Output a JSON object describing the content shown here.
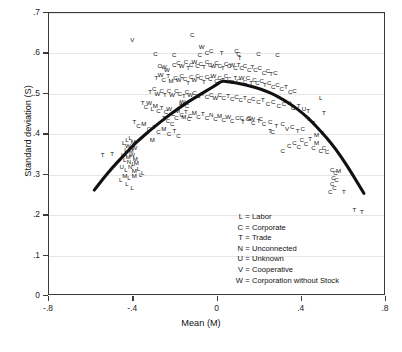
{
  "chart_data": {
    "type": "scatter",
    "title": "",
    "xlabel": "Mean (M)",
    "ylabel": "Standard deviation (S)",
    "xlim": [
      -0.8,
      0.8
    ],
    "ylim": [
      0.0,
      0.7
    ],
    "xticks": [
      "-.8",
      "-.4",
      "0",
      ".4",
      ".8"
    ],
    "xtick_values": [
      -0.8,
      -0.4,
      0,
      0.4,
      0.8
    ],
    "yticks": [
      "0",
      ".1",
      ".2",
      ".3",
      ".4",
      ".5",
      ".6",
      ".7"
    ],
    "ytick_values": [
      0,
      0.1,
      0.2,
      0.3,
      0.4,
      0.5,
      0.6,
      0.7
    ],
    "grid": "horizontal",
    "legend_position": "inside-lower-center",
    "marker_style": "letter-codes",
    "fit_curve": {
      "type": "quadratic",
      "label": "fitted quadratic",
      "color": "#111111",
      "linewidth": 3,
      "peak": [
        0.02,
        0.532
      ],
      "x_start": -0.585,
      "x_end": 0.695,
      "points": [
        [
          -0.585,
          0.262
        ],
        [
          -0.54,
          0.292
        ],
        [
          -0.495,
          0.32
        ],
        [
          -0.45,
          0.345
        ],
        [
          -0.405,
          0.37
        ],
        [
          -0.36,
          0.392
        ],
        [
          -0.315,
          0.412
        ],
        [
          -0.27,
          0.431
        ],
        [
          -0.225,
          0.449
        ],
        [
          -0.18,
          0.466
        ],
        [
          -0.135,
          0.482
        ],
        [
          -0.09,
          0.496
        ],
        [
          -0.045,
          0.51
        ],
        [
          0.0,
          0.524
        ],
        [
          0.02,
          0.532
        ],
        [
          0.045,
          0.53
        ],
        [
          0.09,
          0.527
        ],
        [
          0.135,
          0.522
        ],
        [
          0.18,
          0.516
        ],
        [
          0.225,
          0.508
        ],
        [
          0.27,
          0.498
        ],
        [
          0.315,
          0.485
        ],
        [
          0.36,
          0.47
        ],
        [
          0.405,
          0.452
        ],
        [
          0.45,
          0.43
        ],
        [
          0.495,
          0.405
        ],
        [
          0.54,
          0.378
        ],
        [
          0.585,
          0.346
        ],
        [
          0.63,
          0.31
        ],
        [
          0.695,
          0.254
        ]
      ]
    },
    "legend_entries": [
      {
        "key": "L",
        "eq": "=",
        "label": "Labor"
      },
      {
        "key": "C",
        "eq": "=",
        "label": "Corporate"
      },
      {
        "key": "T",
        "eq": "=",
        "label": "Trade"
      },
      {
        "key": "N",
        "eq": "=",
        "label": "Unconnected"
      },
      {
        "key": "U",
        "eq": "=",
        "label": "Unknown"
      },
      {
        "key": "V",
        "eq": "=",
        "label": "Cooperative"
      },
      {
        "key": "W",
        "eq": "=",
        "label": "Corporation without Stock"
      }
    ],
    "points": [
      [
        "V",
        -0.405,
        0.632
      ],
      [
        "C",
        -0.295,
        0.598
      ],
      [
        "C",
        -0.205,
        0.596
      ],
      [
        "C",
        -0.12,
        0.646
      ],
      [
        "C",
        -0.085,
        0.595
      ],
      [
        "W",
        -0.075,
        0.617
      ],
      [
        "C",
        -0.05,
        0.602
      ],
      [
        "C",
        -0.03,
        0.607
      ],
      [
        "T",
        0.02,
        0.6
      ],
      [
        "C",
        0.09,
        0.605
      ],
      [
        "C",
        0.1,
        0.598
      ],
      [
        "T",
        0.105,
        0.588
      ],
      [
        "C",
        0.195,
        0.598
      ],
      [
        "C",
        0.285,
        0.597
      ],
      [
        "C",
        -0.275,
        0.57
      ],
      [
        "W",
        -0.255,
        0.567
      ],
      [
        "W",
        -0.24,
        0.56
      ],
      [
        "C",
        -0.205,
        0.572
      ],
      [
        "C",
        -0.185,
        0.576
      ],
      [
        "W",
        -0.17,
        0.57
      ],
      [
        "C",
        -0.15,
        0.578
      ],
      [
        "T",
        -0.14,
        0.563
      ],
      [
        "C",
        -0.125,
        0.572
      ],
      [
        "W",
        -0.11,
        0.58
      ],
      [
        "C",
        -0.095,
        0.57
      ],
      [
        "C",
        -0.08,
        0.575
      ],
      [
        "T",
        -0.065,
        0.566
      ],
      [
        "C",
        -0.05,
        0.578
      ],
      [
        "C",
        -0.035,
        0.572
      ],
      [
        "W",
        -0.02,
        0.568
      ],
      [
        "C",
        -0.005,
        0.576
      ],
      [
        "C",
        0.01,
        0.57
      ],
      [
        "T",
        0.025,
        0.564
      ],
      [
        "C",
        0.04,
        0.574
      ],
      [
        "C",
        0.055,
        0.568
      ],
      [
        "W",
        0.07,
        0.571
      ],
      [
        "C",
        0.085,
        0.563
      ],
      [
        "T",
        0.1,
        0.572
      ],
      [
        "C",
        0.115,
        0.565
      ],
      [
        "C",
        0.13,
        0.57
      ],
      [
        "C",
        0.15,
        0.56
      ],
      [
        "T",
        0.165,
        0.566
      ],
      [
        "C",
        0.18,
        0.558
      ],
      [
        "C",
        0.2,
        0.563
      ],
      [
        "C",
        0.22,
        0.552
      ],
      [
        "C",
        0.24,
        0.556
      ],
      [
        "T",
        0.255,
        0.548
      ],
      [
        "C",
        0.275,
        0.552
      ],
      [
        "T",
        -0.29,
        0.54
      ],
      [
        "W",
        -0.27,
        0.546
      ],
      [
        "C",
        -0.255,
        0.535
      ],
      [
        "T",
        -0.235,
        0.543
      ],
      [
        "M",
        -0.22,
        0.531
      ],
      [
        "C",
        -0.2,
        0.54
      ],
      [
        "W",
        -0.185,
        0.534
      ],
      [
        "C",
        -0.17,
        0.544
      ],
      [
        "C",
        -0.155,
        0.536
      ],
      [
        "T",
        -0.14,
        0.528
      ],
      [
        "C",
        -0.125,
        0.542
      ],
      [
        "W",
        -0.11,
        0.534
      ],
      [
        "C",
        -0.095,
        0.545
      ],
      [
        "C",
        -0.08,
        0.538
      ],
      [
        "T",
        -0.065,
        0.53
      ],
      [
        "C",
        -0.05,
        0.541
      ],
      [
        "C",
        -0.035,
        0.536
      ],
      [
        "W",
        -0.02,
        0.544
      ],
      [
        "C",
        -0.005,
        0.533
      ],
      [
        "C",
        0.01,
        0.54
      ],
      [
        "T",
        0.025,
        0.534
      ],
      [
        "C",
        0.04,
        0.543
      ],
      [
        "C",
        0.055,
        0.536
      ],
      [
        "C",
        0.07,
        0.529
      ],
      [
        "T",
        0.085,
        0.54
      ],
      [
        "C",
        0.1,
        0.532
      ],
      [
        "W",
        0.115,
        0.538
      ],
      [
        "C",
        0.13,
        0.53
      ],
      [
        "C",
        0.145,
        0.538
      ],
      [
        "T",
        0.16,
        0.528
      ],
      [
        "C",
        0.175,
        0.534
      ],
      [
        "C",
        0.19,
        0.526
      ],
      [
        "C",
        0.21,
        0.531
      ],
      [
        "T",
        0.225,
        0.522
      ],
      [
        "C",
        0.245,
        0.527
      ],
      [
        "C",
        0.265,
        0.518
      ],
      [
        "C",
        0.285,
        0.521
      ],
      [
        "C",
        0.305,
        0.513
      ],
      [
        "T",
        0.325,
        0.516
      ],
      [
        "C",
        0.345,
        0.505
      ],
      [
        "C",
        0.365,
        0.508
      ],
      [
        "T",
        -0.32,
        0.505
      ],
      [
        "C",
        -0.3,
        0.512
      ],
      [
        "W",
        -0.285,
        0.5
      ],
      [
        "C",
        -0.265,
        0.508
      ],
      [
        "T",
        -0.25,
        0.497
      ],
      [
        "C",
        -0.23,
        0.506
      ],
      [
        "W",
        -0.215,
        0.498
      ],
      [
        "C",
        -0.195,
        0.508
      ],
      [
        "C",
        -0.18,
        0.5
      ],
      [
        "T",
        -0.16,
        0.495
      ],
      [
        "C",
        -0.145,
        0.505
      ],
      [
        "W",
        -0.13,
        0.497
      ],
      [
        "C",
        -0.11,
        0.503
      ],
      [
        "C",
        -0.09,
        0.495
      ],
      [
        "T",
        -0.07,
        0.5
      ],
      [
        "C",
        -0.05,
        0.493
      ],
      [
        "C",
        -0.03,
        0.498
      ],
      [
        "W",
        -0.01,
        0.49
      ],
      [
        "C",
        0.01,
        0.496
      ],
      [
        "C",
        0.03,
        0.489
      ],
      [
        "T",
        0.05,
        0.494
      ],
      [
        "C",
        0.07,
        0.487
      ],
      [
        "C",
        0.09,
        0.492
      ],
      [
        "C",
        0.11,
        0.485
      ],
      [
        "T",
        0.13,
        0.49
      ],
      [
        "C",
        0.15,
        0.482
      ],
      [
        "C",
        0.17,
        0.487
      ],
      [
        "C",
        0.195,
        0.479
      ],
      [
        "T",
        0.215,
        0.484
      ],
      [
        "C",
        0.24,
        0.476
      ],
      [
        "C",
        0.265,
        0.48
      ],
      [
        "C",
        0.29,
        0.471
      ],
      [
        "C",
        0.315,
        0.474
      ],
      [
        "U",
        0.34,
        0.478
      ],
      [
        "C",
        0.36,
        0.466
      ],
      [
        "T",
        0.385,
        0.47
      ],
      [
        "U",
        0.41,
        0.462
      ],
      [
        "T",
        0.43,
        0.458
      ],
      [
        "L",
        0.49,
        0.49
      ],
      [
        "T",
        0.505,
        0.452
      ],
      [
        "T",
        -0.355,
        0.477
      ],
      [
        "C",
        -0.34,
        0.468
      ],
      [
        "W",
        -0.325,
        0.478
      ],
      [
        "L",
        -0.31,
        0.462
      ],
      [
        "M",
        -0.295,
        0.47
      ],
      [
        "C",
        -0.28,
        0.458
      ],
      [
        "T",
        -0.265,
        0.466
      ],
      [
        "C",
        -0.245,
        0.455
      ],
      [
        "W",
        -0.23,
        0.462
      ],
      [
        "C",
        -0.21,
        0.45
      ],
      [
        "M",
        -0.19,
        0.458
      ],
      [
        "C",
        -0.17,
        0.448
      ],
      [
        "T",
        -0.15,
        0.455
      ],
      [
        "C",
        -0.13,
        0.445
      ],
      [
        "M",
        -0.11,
        0.452
      ],
      [
        "C",
        -0.09,
        0.443
      ],
      [
        "T",
        -0.07,
        0.45
      ],
      [
        "C",
        -0.05,
        0.44
      ],
      [
        "N",
        -0.03,
        0.448
      ],
      [
        "C",
        -0.01,
        0.438
      ],
      [
        "M",
        0.01,
        0.446
      ],
      [
        "C",
        0.03,
        0.436
      ],
      [
        "W",
        0.05,
        0.443
      ],
      [
        "C",
        0.07,
        0.433
      ],
      [
        "C",
        0.095,
        0.44
      ],
      [
        "T",
        0.12,
        0.43
      ],
      [
        "C",
        0.145,
        0.437
      ],
      [
        "C",
        0.17,
        0.428
      ],
      [
        "T",
        0.195,
        0.434
      ],
      [
        "C",
        0.22,
        0.425
      ],
      [
        "C",
        0.25,
        0.43
      ],
      [
        "T",
        0.28,
        0.42
      ],
      [
        "C",
        0.31,
        0.425
      ],
      [
        "V",
        0.33,
        0.413
      ],
      [
        "C",
        0.355,
        0.418
      ],
      [
        "T",
        0.38,
        0.408
      ],
      [
        "C",
        0.405,
        0.414
      ],
      [
        "T",
        0.43,
        0.438
      ],
      [
        "T",
        0.455,
        0.428
      ],
      [
        "M",
        0.47,
        0.398
      ],
      [
        "T",
        0.495,
        0.402
      ],
      [
        "T",
        -0.395,
        0.43
      ],
      [
        "C",
        -0.375,
        0.42
      ],
      [
        "M",
        -0.35,
        0.425
      ],
      [
        "C",
        -0.325,
        0.412
      ],
      [
        "T",
        -0.3,
        0.418
      ],
      [
        "C",
        -0.28,
        0.405
      ],
      [
        "M",
        -0.255,
        0.412
      ],
      [
        "C",
        -0.23,
        0.4
      ],
      [
        "T",
        -0.205,
        0.408
      ],
      [
        "C",
        -0.185,
        0.396
      ],
      [
        "M",
        -0.31,
        0.385
      ],
      [
        "L",
        -0.415,
        0.392
      ],
      [
        "L",
        -0.43,
        0.386
      ],
      [
        "L",
        -0.445,
        0.378
      ],
      [
        "M",
        -0.4,
        0.38
      ],
      [
        "W",
        -0.425,
        0.37
      ],
      [
        "L",
        -0.435,
        0.362
      ],
      [
        "M",
        -0.41,
        0.358
      ],
      [
        "W",
        -0.395,
        0.365
      ],
      [
        "T",
        -0.5,
        0.352
      ],
      [
        "L",
        -0.45,
        0.348
      ],
      [
        "M",
        -0.425,
        0.345
      ],
      [
        "W",
        -0.405,
        0.35
      ],
      [
        "M",
        -0.39,
        0.34
      ],
      [
        "L",
        -0.44,
        0.336
      ],
      [
        "N",
        -0.42,
        0.332
      ],
      [
        "L",
        -0.4,
        0.326
      ],
      [
        "M",
        -0.385,
        0.33
      ],
      [
        "U",
        -0.455,
        0.318
      ],
      [
        "L",
        -0.435,
        0.312
      ],
      [
        "N",
        -0.415,
        0.318
      ],
      [
        "M",
        -0.395,
        0.308
      ],
      [
        "L",
        -0.375,
        0.315
      ],
      [
        "L",
        -0.355,
        0.305
      ],
      [
        "M",
        -0.44,
        0.298
      ],
      [
        "L",
        -0.42,
        0.292
      ],
      [
        "M",
        -0.395,
        0.296
      ],
      [
        "L",
        -0.46,
        0.286
      ],
      [
        "L",
        -0.43,
        0.278
      ],
      [
        "L",
        -0.405,
        0.268
      ],
      [
        "C",
        0.34,
        0.37
      ],
      [
        "C",
        0.365,
        0.378
      ],
      [
        "C",
        0.385,
        0.368
      ],
      [
        "C",
        0.4,
        0.385
      ],
      [
        "C",
        0.42,
        0.375
      ],
      [
        "T",
        0.44,
        0.388
      ],
      [
        "C",
        0.455,
        0.365
      ],
      [
        "M",
        0.47,
        0.378
      ],
      [
        "C",
        0.49,
        0.358
      ],
      [
        "C",
        0.505,
        0.365
      ],
      [
        "C",
        0.52,
        0.355
      ],
      [
        "C",
        0.31,
        0.358
      ],
      [
        "C",
        0.545,
        0.312
      ],
      [
        "C",
        0.56,
        0.305
      ],
      [
        "M",
        0.575,
        0.31
      ],
      [
        "C",
        0.55,
        0.292
      ],
      [
        "C",
        0.565,
        0.288
      ],
      [
        "C",
        0.545,
        0.278
      ],
      [
        "C",
        0.555,
        0.268
      ],
      [
        "C",
        0.535,
        0.258
      ],
      [
        "T",
        0.6,
        0.258
      ],
      [
        "T",
        0.65,
        0.212
      ],
      [
        "T",
        0.685,
        0.208
      ],
      [
        "T",
        0.25,
        0.408
      ],
      [
        "C",
        0.262,
        0.405
      ],
      [
        "C",
        0.205,
        0.437
      ],
      [
        "C",
        0.15,
        0.44
      ],
      [
        "W",
        0.165,
        0.437
      ],
      [
        "C",
        0.115,
        0.44
      ],
      [
        "C",
        -0.135,
        0.438
      ],
      [
        "M",
        -0.16,
        0.442
      ],
      [
        "C",
        -0.215,
        0.425
      ],
      [
        "C",
        -0.235,
        0.432
      ],
      [
        "T",
        -0.255,
        0.44
      ],
      [
        "C",
        -0.195,
        0.44
      ],
      [
        "L",
        -0.175,
        0.478
      ],
      [
        "C",
        -0.145,
        0.47
      ],
      [
        "W",
        -0.165,
        0.48
      ],
      [
        "L",
        -0.365,
        0.3
      ],
      [
        "T",
        -0.545,
        0.348
      ]
    ]
  }
}
